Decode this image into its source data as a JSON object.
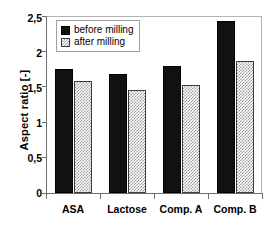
{
  "chart_data": {
    "type": "bar",
    "title": "",
    "xlabel": "",
    "ylabel": "Aspect ratio [-]",
    "categories": [
      "ASA",
      "Lactose",
      "Comp. A",
      "Comp. B"
    ],
    "series": [
      {
        "name": "before milling",
        "values": [
          1.75,
          1.68,
          1.8,
          2.43
        ],
        "color": "#111111",
        "pattern": "solid"
      },
      {
        "name": "after milling",
        "values": [
          1.58,
          1.46,
          1.52,
          1.86
        ],
        "color": "#9a9a9a",
        "pattern": "checker-hatch"
      }
    ],
    "ylim": [
      0,
      2.5
    ],
    "y_ticks": [
      0,
      0.5,
      1,
      1.5,
      2,
      2.5
    ],
    "y_tick_labels": [
      "0",
      "0,5",
      "1",
      "1,5",
      "2",
      "2,5"
    ],
    "decimal_separator": ",",
    "grid": false,
    "legend_position": "top-left",
    "frame": true
  },
  "axis": {
    "y_title": "Aspect ratio [-]"
  },
  "legend": {
    "entries": [
      {
        "label": "before milling"
      },
      {
        "label": "after milling"
      }
    ]
  }
}
